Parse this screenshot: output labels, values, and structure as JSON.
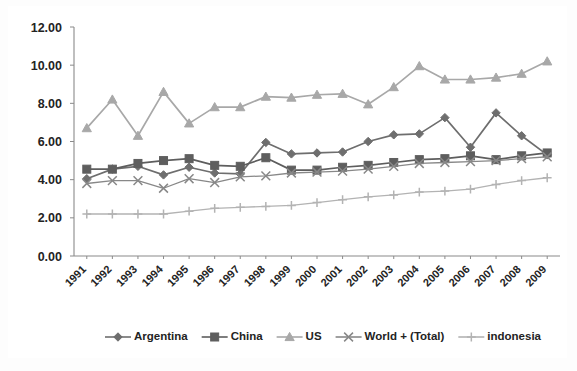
{
  "chart_data": {
    "type": "line",
    "title": "",
    "xlabel": "",
    "ylabel": "",
    "ylim": [
      0,
      12
    ],
    "ytick_labels": [
      "0.00",
      "2.00",
      "4.00",
      "6.00",
      "8.00",
      "10.00",
      "12.00"
    ],
    "ytick_values": [
      0,
      2,
      4,
      6,
      8,
      10,
      12
    ],
    "grid": false,
    "legend_position": "bottom",
    "categories": [
      "1991",
      "1992",
      "1993",
      "1994",
      "1995",
      "1996",
      "1997",
      "1998",
      "1999",
      "2000",
      "2001",
      "2002",
      "2003",
      "2004",
      "2005",
      "2006",
      "2007",
      "2008",
      "2009"
    ],
    "series": [
      {
        "name": "Argentina",
        "marker": "diamond",
        "color": "#6e6e6e",
        "values": [
          4.05,
          4.55,
          4.7,
          4.25,
          4.65,
          4.35,
          4.3,
          5.95,
          5.35,
          5.4,
          5.45,
          6.0,
          6.35,
          6.4,
          7.25,
          5.7,
          7.5,
          6.3,
          5.3
        ]
      },
      {
        "name": "China",
        "marker": "square",
        "color": "#5e5e5e",
        "values": [
          4.55,
          4.55,
          4.85,
          5.0,
          5.1,
          4.75,
          4.7,
          5.15,
          4.5,
          4.5,
          4.65,
          4.75,
          4.9,
          5.05,
          5.1,
          5.25,
          5.05,
          5.25,
          5.4
        ]
      },
      {
        "name": "US",
        "marker": "triangle",
        "color": "#a8a8a8",
        "values": [
          6.7,
          8.2,
          6.3,
          8.6,
          6.95,
          7.8,
          7.8,
          8.35,
          8.3,
          8.45,
          8.5,
          7.95,
          8.85,
          9.95,
          9.25,
          9.25,
          9.35,
          9.55,
          10.2
        ]
      },
      {
        "name": "World + (Total)",
        "marker": "cross-x",
        "color": "#888888",
        "values": [
          3.8,
          3.95,
          3.95,
          3.55,
          4.05,
          3.85,
          4.15,
          4.2,
          4.35,
          4.4,
          4.45,
          4.55,
          4.7,
          4.85,
          4.9,
          4.95,
          5.0,
          5.1,
          5.2
        ]
      },
      {
        "name": "indonesia",
        "marker": "plus",
        "color": "#b3b3b3",
        "values": [
          2.2,
          2.2,
          2.2,
          2.2,
          2.35,
          2.5,
          2.55,
          2.6,
          2.65,
          2.8,
          2.95,
          3.1,
          3.2,
          3.35,
          3.4,
          3.5,
          3.75,
          3.95,
          4.1
        ]
      }
    ]
  },
  "legend": {
    "items": [
      {
        "label": "Argentina"
      },
      {
        "label": "China"
      },
      {
        "label": "US"
      },
      {
        "label": "World + (Total)"
      },
      {
        "label": "indonesia"
      }
    ]
  }
}
